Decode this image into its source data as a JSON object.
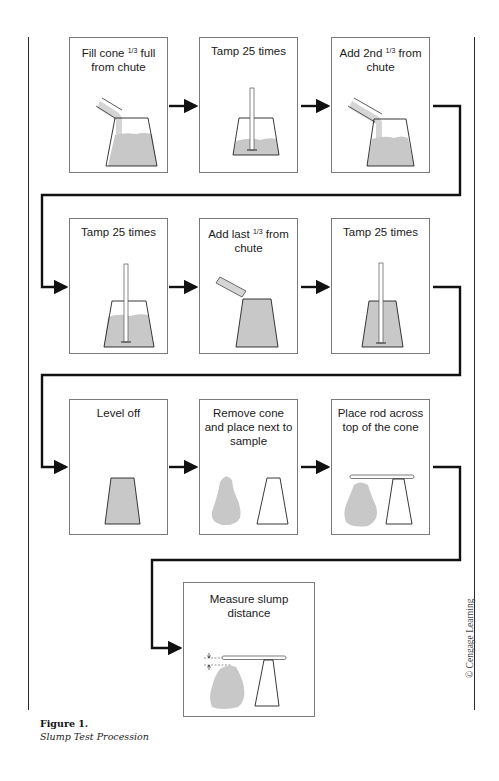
{
  "figure": {
    "label": "Figure 1.",
    "caption": "Slump Test Procession",
    "credit": "© Cengage Learning"
  },
  "colors": {
    "concrete_fill": "#c8c8c8",
    "line": "#111111",
    "box_border": "#7a7a7a"
  },
  "steps": [
    {
      "order": 1,
      "title_pre": "Fill cone ",
      "frac": "1/3",
      "title_post": " full from chute",
      "art": "pour-first-third"
    },
    {
      "order": 2,
      "title_pre": "Tamp 25 times",
      "frac": "",
      "title_post": "",
      "art": "tamp-one-third"
    },
    {
      "order": 3,
      "title_pre": "Add 2nd ",
      "frac": "1/3",
      "title_post": " from chute",
      "art": "pour-second-third"
    },
    {
      "order": 4,
      "title_pre": "Tamp 25 times",
      "frac": "",
      "title_post": "",
      "art": "tamp-two-thirds"
    },
    {
      "order": 5,
      "title_pre": "Add last ",
      "frac": "1/3",
      "title_post": " from chute",
      "art": "pour-last-third"
    },
    {
      "order": 6,
      "title_pre": "Tamp 25 times",
      "frac": "",
      "title_post": "",
      "art": "tamp-full"
    },
    {
      "order": 7,
      "title_pre": "Level off",
      "frac": "",
      "title_post": "",
      "art": "level-off"
    },
    {
      "order": 8,
      "title_pre": "Remove cone and place next to sample",
      "frac": "",
      "title_post": "",
      "art": "remove-cone"
    },
    {
      "order": 9,
      "title_pre": "Place rod across top of the cone",
      "frac": "",
      "title_post": "",
      "art": "rod-across"
    },
    {
      "order": 10,
      "title_pre": "Measure slump distance",
      "frac": "",
      "title_post": "",
      "art": "measure-slump"
    }
  ]
}
